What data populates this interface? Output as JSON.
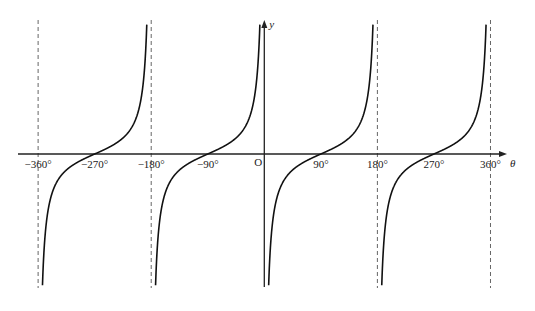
{
  "chart_data": {
    "type": "line",
    "title": "",
    "function": "y = -cot θ",
    "xlabel": "θ",
    "ylabel": "y",
    "origin_label": "O",
    "xlim": [
      -360,
      360
    ],
    "x_ticks": [
      -360,
      -270,
      -180,
      -90,
      90,
      180,
      270,
      360
    ],
    "x_tick_labels": [
      "−360°",
      "−270°",
      "−180°",
      "−90°",
      "90°",
      "180°",
      "270°",
      "360°"
    ],
    "asymptotes": [
      -360,
      -180,
      180,
      360
    ],
    "asymptote_style": "dashed",
    "zeros": [
      -270,
      -90,
      90,
      270
    ],
    "branches": [
      {
        "from": -360,
        "to": -180,
        "zero": -270
      },
      {
        "from": -180,
        "to": 0,
        "zero": -90
      },
      {
        "from": 0,
        "to": 180,
        "zero": 90
      },
      {
        "from": 180,
        "to": 360,
        "zero": 270
      }
    ],
    "grid": false,
    "legend": null
  },
  "layout": {
    "origin_px": [
      264.3,
      154
    ],
    "px_per_degree": 0.6283,
    "y_scale_px": 16,
    "y_clip_px": 132,
    "curve_color": "#111111",
    "axis_color": "#222222",
    "asymptote_color": "#555555"
  }
}
